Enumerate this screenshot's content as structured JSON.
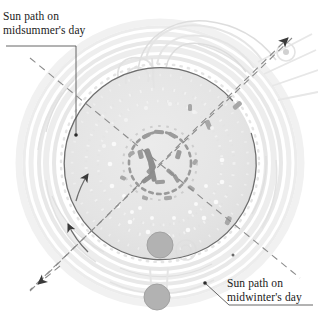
{
  "diagram": {
    "labels": {
      "midsummer": {
        "line1": "Sun path on",
        "line2": "midsummer's day"
      },
      "midwinter": {
        "line1": "Sun path on",
        "line2": "midwinter's day"
      }
    },
    "colors": {
      "background": "#ffffff",
      "text": "#1a1a1a",
      "disc_fill": "#e2e2e2",
      "disc_stroke": "#6e6e6e",
      "dashed_line": "#8c8c8c",
      "stone_marker": "#b0b0b0",
      "stone_marker_stroke": "#9a9a9a",
      "earthwork_faint": "#e8e8e8",
      "earthwork_mid": "#dcdcdc",
      "stone_dark": "#9e9e9e",
      "leader_line": "#555555"
    },
    "geometry": {
      "center_x": 160,
      "center_y": 163,
      "disc_radius": 96,
      "arc_gap_start_deg": -62,
      "arc_gap_end_deg": -18
    },
    "alignments": [
      {
        "name": "midsummer-sunrise-axis",
        "direction": "northeast",
        "arrow": "outward-northeast",
        "angle_deg": 41
      },
      {
        "name": "midwinter-sunset-axis",
        "direction": "southwest",
        "arrow": "outward-southwest",
        "angle_deg": 221
      }
    ],
    "markers": [
      {
        "name": "heel-stone",
        "cx": 160,
        "cy": 245,
        "r": 13
      },
      {
        "name": "slaughter-stone",
        "cx": 157,
        "cy": 297,
        "r": 13
      }
    ]
  }
}
